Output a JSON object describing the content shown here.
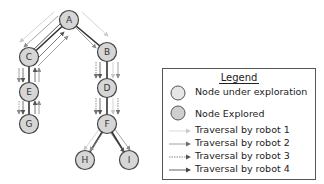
{
  "diagram": {
    "nodes": [
      {
        "id": "A",
        "label": "A",
        "x": 69,
        "y": 20,
        "state": "explored"
      },
      {
        "id": "B",
        "label": "B",
        "x": 107,
        "y": 52,
        "state": "explored"
      },
      {
        "id": "C",
        "label": "C",
        "x": 29,
        "y": 57,
        "state": "explored"
      },
      {
        "id": "D",
        "label": "D",
        "x": 107,
        "y": 88,
        "state": "explored"
      },
      {
        "id": "E",
        "label": "E",
        "x": 29,
        "y": 92,
        "state": "explored"
      },
      {
        "id": "F",
        "label": "F",
        "x": 107,
        "y": 124,
        "state": "explored"
      },
      {
        "id": "G",
        "label": "G",
        "x": 29,
        "y": 124,
        "state": "explored"
      },
      {
        "id": "H",
        "label": "H",
        "x": 85,
        "y": 160,
        "state": "explored"
      },
      {
        "id": "I",
        "label": "I",
        "x": 129,
        "y": 160,
        "state": "explored"
      }
    ],
    "edges": [
      {
        "from": "A",
        "to": "C"
      },
      {
        "from": "A",
        "to": "B"
      },
      {
        "from": "C",
        "to": "E"
      },
      {
        "from": "E",
        "to": "G"
      },
      {
        "from": "B",
        "to": "D"
      },
      {
        "from": "D",
        "to": "F"
      },
      {
        "from": "F",
        "to": "H"
      },
      {
        "from": "F",
        "to": "I"
      }
    ]
  },
  "legend": {
    "title": "Legend",
    "items": [
      {
        "label": "Node under exploration",
        "symbol": "circle-light"
      },
      {
        "label": "Node Explored",
        "symbol": "circle-gray"
      },
      {
        "label": "Traversal by robot 1",
        "symbol": "arrow-robot-1"
      },
      {
        "label": "Traversal by robot 2",
        "symbol": "arrow-robot-2"
      },
      {
        "label": "Traversal by robot 3",
        "symbol": "arrow-robot-3"
      },
      {
        "label": "Traversal by robot 4",
        "symbol": "arrow-robot-4"
      }
    ]
  },
  "colors": {
    "node_under_exploration": "#e6e6e6",
    "node_explored": "#d0d0d0",
    "node_stroke": "#444444",
    "edge": "#333333",
    "robot1": "#c8c8c8",
    "robot2": "#8c8c8c",
    "robot3": "#707070",
    "robot4": "#555555"
  }
}
